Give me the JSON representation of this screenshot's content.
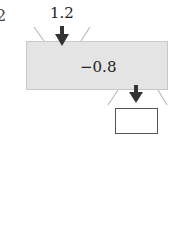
{
  "problem_number": "2",
  "input_value": "1.2",
  "operation": "−0.8",
  "output_box_value": "",
  "colors": {
    "machine_fill": "#e4e4e4",
    "arrow": "#333333",
    "funnel_lines": "#bbbbbb"
  }
}
